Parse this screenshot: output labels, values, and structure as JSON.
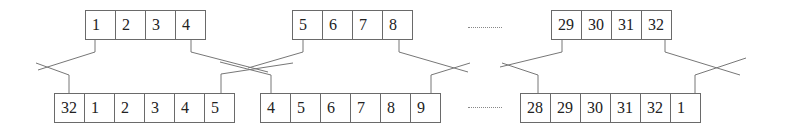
{
  "diagram": {
    "title": "",
    "top_rows": [
      {
        "cells": [
          "1",
          "2",
          "3",
          "4"
        ]
      },
      {
        "cells": [
          "5",
          "6",
          "7",
          "8"
        ]
      },
      {
        "cells": [
          "29",
          "30",
          "31",
          "32"
        ]
      }
    ],
    "bottom_rows": [
      {
        "cells": [
          "32",
          "1",
          "2",
          "3",
          "4",
          "5"
        ]
      },
      {
        "cells": [
          "4",
          "5",
          "6",
          "7",
          "8",
          "9"
        ]
      },
      {
        "cells": [
          "28",
          "29",
          "30",
          "31",
          "32",
          "1"
        ]
      }
    ],
    "ellipsis": ".........."
  }
}
